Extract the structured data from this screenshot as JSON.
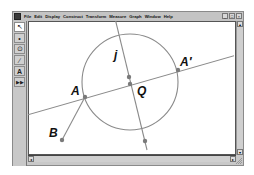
{
  "menubar": {
    "items": [
      "File",
      "Edit",
      "Display",
      "Construct",
      "Transform",
      "Measure",
      "Graph",
      "Window",
      "Help"
    ],
    "window_buttons": [
      "_",
      "□",
      "×"
    ]
  },
  "toolbar": {
    "tools": [
      {
        "name": "selection-arrow-tool",
        "glyph": "↖",
        "active": true
      },
      {
        "name": "point-tool",
        "glyph": "•",
        "active": false
      },
      {
        "name": "compass-tool",
        "glyph": "⊙",
        "active": false
      },
      {
        "name": "straightedge-tool",
        "glyph": "∕",
        "active": false
      },
      {
        "name": "text-tool",
        "glyph": "A",
        "active": false
      },
      {
        "name": "custom-tool",
        "glyph": "▶▶",
        "active": false
      }
    ]
  },
  "scroll": {
    "up": "▴",
    "down": "▾",
    "left": "◂",
    "right": "▸"
  },
  "sketch": {
    "labels": {
      "j": "j",
      "A": "A",
      "A_prime": "A′",
      "Q": "Q",
      "B": "B"
    },
    "colors": {
      "stroke": "#8a8a8a",
      "point": "#7a7a7a",
      "label": "#111111"
    }
  }
}
